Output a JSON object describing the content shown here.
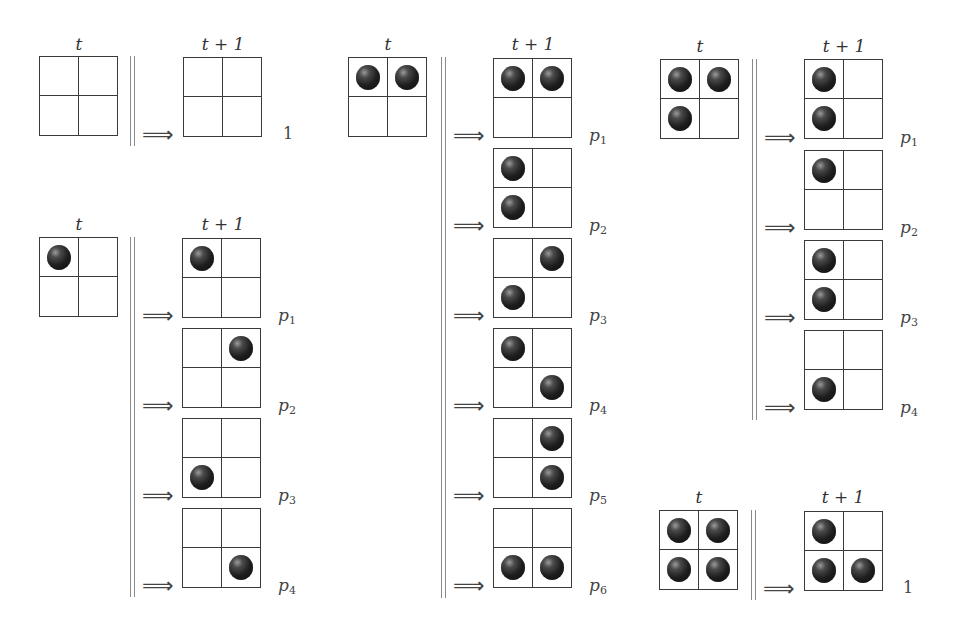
{
  "figure": {
    "time_label_t": "t",
    "time_label_t1": "t + 1",
    "arrow_glyph": "⟹",
    "colors": {
      "grid_line": "#3a3a3a",
      "ball": "#1e1e1e",
      "separator": "#8a8a8a"
    }
  },
  "panels": [
    {
      "id": "empty",
      "from": [
        0,
        0,
        0,
        0
      ],
      "outcomes": [
        {
          "cells": [
            0,
            0,
            0,
            0
          ],
          "prob": "1",
          "prob_var": "",
          "prob_sub": ""
        }
      ]
    },
    {
      "id": "one-ball",
      "from": [
        1,
        0,
        0,
        0
      ],
      "outcomes": [
        {
          "cells": [
            1,
            0,
            0,
            0
          ],
          "prob_var": "p",
          "prob_sub": "1"
        },
        {
          "cells": [
            0,
            1,
            0,
            0
          ],
          "prob_var": "p",
          "prob_sub": "2"
        },
        {
          "cells": [
            0,
            0,
            1,
            0
          ],
          "prob_var": "p",
          "prob_sub": "3"
        },
        {
          "cells": [
            0,
            0,
            0,
            1
          ],
          "prob_var": "p",
          "prob_sub": "4"
        }
      ]
    },
    {
      "id": "two-balls",
      "from": [
        1,
        1,
        0,
        0
      ],
      "outcomes": [
        {
          "cells": [
            1,
            1,
            0,
            0
          ],
          "prob_var": "p",
          "prob_sub": "1"
        },
        {
          "cells": [
            1,
            0,
            1,
            0
          ],
          "prob_var": "p",
          "prob_sub": "2"
        },
        {
          "cells": [
            0,
            1,
            1,
            0
          ],
          "prob_var": "p",
          "prob_sub": "3"
        },
        {
          "cells": [
            1,
            0,
            0,
            1
          ],
          "prob_var": "p",
          "prob_sub": "4"
        },
        {
          "cells": [
            0,
            1,
            0,
            1
          ],
          "prob_var": "p",
          "prob_sub": "5"
        },
        {
          "cells": [
            0,
            0,
            1,
            1
          ],
          "prob_var": "p",
          "prob_sub": "6"
        }
      ]
    },
    {
      "id": "three-balls",
      "from": [
        1,
        1,
        1,
        0
      ],
      "outcomes": [
        {
          "cells": [
            1,
            0,
            1,
            0
          ],
          "prob_var": "p",
          "prob_sub": "1"
        },
        {
          "cells": [
            1,
            0,
            0,
            0
          ],
          "prob_var": "p",
          "prob_sub": "2"
        },
        {
          "cells": [
            1,
            0,
            1,
            0
          ],
          "prob_var": "p",
          "prob_sub": "3"
        },
        {
          "cells": [
            0,
            0,
            1,
            0
          ],
          "prob_var": "p",
          "prob_sub": "4"
        }
      ]
    },
    {
      "id": "four-balls",
      "from": [
        1,
        1,
        1,
        1
      ],
      "outcomes": [
        {
          "cells": [
            1,
            0,
            1,
            1
          ],
          "prob": "1",
          "prob_var": "",
          "prob_sub": ""
        }
      ]
    }
  ],
  "labels": {
    "p0_t": "t",
    "p0_t1": "t + 1",
    "p0_prob": "1",
    "p1_t": "t",
    "p1_t1": "t + 1",
    "p2_t": "t",
    "p2_t1": "t + 1",
    "p3_t": "t",
    "p3_t1": "t + 1",
    "p4_t": "t",
    "p4_t1": "t + 1",
    "p4_prob": "1",
    "arrow": "⟹",
    "p": "p",
    "s1": "1",
    "s2": "2",
    "s3": "3",
    "s4": "4",
    "s5": "5",
    "s6": "6"
  }
}
